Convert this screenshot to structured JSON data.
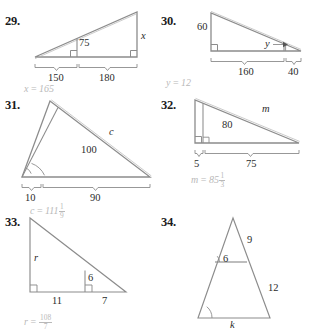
{
  "page": {
    "background": "#ffffff",
    "ink": "#2b2b2b",
    "answer_color": "#b9b9b9"
  },
  "problems": [
    {
      "number": "29.",
      "labels": {
        "altitude": "75",
        "right_side": "x",
        "base_left": "150",
        "base_right": "180"
      },
      "answer": {
        "var": "x",
        "eq": " = ",
        "value": "165"
      }
    },
    {
      "number": "30.",
      "labels": {
        "left_side": "60",
        "inner": "y",
        "base_left": "160",
        "base_right": "40"
      },
      "answer": {
        "var": "y",
        "eq": " = ",
        "value": "12"
      }
    },
    {
      "number": "31.",
      "labels": {
        "hyp_outer": "c",
        "cevian": "100",
        "base_left": "10",
        "base_right": "90"
      },
      "answer": {
        "var": "c",
        "eq": " = ",
        "value": "111",
        "frac_num": "1",
        "frac_den": "9"
      }
    },
    {
      "number": "32.",
      "labels": {
        "hyp_outer": "m",
        "cevian": "80",
        "base_left": "5",
        "base_right": "75"
      },
      "answer": {
        "var": "m",
        "eq": " = ",
        "value": "85",
        "frac_num": "1",
        "frac_den": "3"
      }
    },
    {
      "number": "33.",
      "labels": {
        "left_side": "r",
        "inner": "6",
        "base_left": "11",
        "base_right": "7"
      },
      "answer": {
        "var": "r",
        "eq": " = ",
        "value": "",
        "frac_num": "108",
        "frac_den": "7"
      }
    },
    {
      "number": "34.",
      "labels": {
        "upper_right": "9",
        "inner_segment": "6",
        "lower_right": "12",
        "base": "k"
      },
      "answer": null
    }
  ]
}
